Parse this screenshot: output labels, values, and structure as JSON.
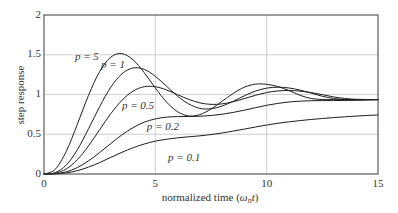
{
  "chart_data": {
    "type": "line",
    "title": "",
    "xlabel": "normalized time (ω_n t)",
    "xlabel_parts": {
      "prefix": "normalized time (",
      "symbol": "ω",
      "subscript": "n",
      "var": "t",
      "suffix": ")"
    },
    "ylabel": "step response",
    "xlim": [
      0,
      15
    ],
    "ylim": [
      0,
      2
    ],
    "xticks": [
      0,
      5,
      10,
      15
    ],
    "xtick_labels": [
      "0",
      "5",
      "10",
      "15"
    ],
    "yticks": [
      0,
      0.5,
      1,
      1.5,
      2
    ],
    "ytick_labels": [
      "0",
      "0.5",
      "1",
      "1.5",
      "2"
    ],
    "grid": true,
    "legend": "inline labels",
    "x": [
      0,
      0.5,
      1,
      1.5,
      2,
      2.5,
      3,
      3.5,
      4,
      4.5,
      5,
      5.5,
      6,
      6.5,
      7,
      7.5,
      8,
      8.5,
      9,
      9.5,
      10,
      10.5,
      11,
      11.5,
      12,
      12.5,
      13,
      13.5,
      14,
      14.5,
      15
    ],
    "series": [
      {
        "name": "p = 5",
        "label": "p = 5",
        "label_pos": [
          1.39,
          1.46
        ],
        "values": [
          0,
          0.058,
          0.285,
          0.627,
          0.99,
          1.289,
          1.47,
          1.514,
          1.436,
          1.275,
          1.082,
          0.906,
          0.783,
          0.73,
          0.747,
          0.817,
          0.915,
          1.014,
          1.092,
          1.13,
          1.128,
          1.1,
          1.05,
          0.99,
          0.95,
          0.937,
          0.935,
          0.935,
          0.935,
          0.935,
          0.935
        ]
      },
      {
        "name": "p = 1",
        "label": "p = 1",
        "label_pos": [
          2.56,
          1.36
        ],
        "values": [
          0,
          0.017,
          0.113,
          0.306,
          0.568,
          0.847,
          1.092,
          1.26,
          1.334,
          1.316,
          1.229,
          1.105,
          0.979,
          0.881,
          0.826,
          0.82,
          0.855,
          0.915,
          0.984,
          1.043,
          1.08,
          1.092,
          1.082,
          1.055,
          1.018,
          0.978,
          0.95,
          0.937,
          0.935,
          0.935,
          0.935
        ]
      },
      {
        "name": "p = 0.5",
        "label": "p = 0.5",
        "label_pos": [
          3.5,
          0.855
        ],
        "values": [
          0,
          0.009,
          0.064,
          0.181,
          0.354,
          0.557,
          0.759,
          0.927,
          1.043,
          1.098,
          1.098,
          1.058,
          0.998,
          0.939,
          0.895,
          0.876,
          0.882,
          0.91,
          0.949,
          0.99,
          1.024,
          1.045,
          1.05,
          1.042,
          1.024,
          0.998,
          0.97,
          0.95,
          0.94,
          0.937,
          0.936
        ]
      },
      {
        "name": "p = 0.2",
        "label": "p = 0.2",
        "label_pos": [
          4.62,
          0.58
        ],
        "values": [
          0,
          0.004,
          0.027,
          0.081,
          0.165,
          0.27,
          0.383,
          0.492,
          0.583,
          0.651,
          0.693,
          0.715,
          0.722,
          0.723,
          0.726,
          0.736,
          0.752,
          0.775,
          0.803,
          0.834,
          0.864,
          0.888,
          0.906,
          0.916,
          0.922,
          0.923,
          0.924,
          0.925,
          0.927,
          0.931,
          0.936
        ]
      },
      {
        "name": "p = 0.1",
        "label": "p = 0.1",
        "label_pos": [
          5.57,
          0.2
        ],
        "values": [
          0,
          0.002,
          0.014,
          0.042,
          0.087,
          0.144,
          0.209,
          0.273,
          0.33,
          0.377,
          0.413,
          0.437,
          0.455,
          0.468,
          0.48,
          0.496,
          0.516,
          0.54,
          0.565,
          0.591,
          0.616,
          0.638,
          0.656,
          0.672,
          0.686,
          0.698,
          0.709,
          0.719,
          0.728,
          0.736,
          0.742
        ]
      }
    ],
    "colors": {
      "curve": "#1e1e1e",
      "grid": "#c4c4c4",
      "frame": "#3a3a3a"
    }
  }
}
